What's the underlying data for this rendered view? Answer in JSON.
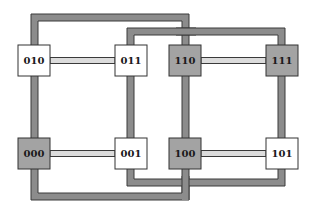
{
  "diagram": {
    "colors": {
      "loop_fill": "#8c8c8c",
      "loop_stroke": "#3a3a3a",
      "link_fill": "#dcdcdc",
      "link_stroke": "#3a3a3a",
      "node_white": "#ffffff",
      "node_gray": "#a3a3a3",
      "node_stroke": "#333333"
    },
    "nodes": [
      {
        "id": "010",
        "label": "010",
        "shade": "white"
      },
      {
        "id": "011",
        "label": "011",
        "shade": "white"
      },
      {
        "id": "110",
        "label": "110",
        "shade": "gray"
      },
      {
        "id": "111",
        "label": "111",
        "shade": "gray"
      },
      {
        "id": "000",
        "label": "000",
        "shade": "gray"
      },
      {
        "id": "001",
        "label": "001",
        "shade": "white"
      },
      {
        "id": "100",
        "label": "100",
        "shade": "gray"
      },
      {
        "id": "101",
        "label": "101",
        "shade": "white"
      }
    ],
    "horizontal_links": [
      {
        "from": "010",
        "to": "011"
      },
      {
        "from": "110",
        "to": "111"
      },
      {
        "from": "000",
        "to": "001"
      },
      {
        "from": "100",
        "to": "101"
      }
    ],
    "loops": [
      {
        "name": "outer-loop",
        "nodes": [
          "010",
          "110",
          "100",
          "000"
        ]
      },
      {
        "name": "inner-loop",
        "nodes": [
          "011",
          "111",
          "101",
          "001"
        ]
      }
    ]
  }
}
